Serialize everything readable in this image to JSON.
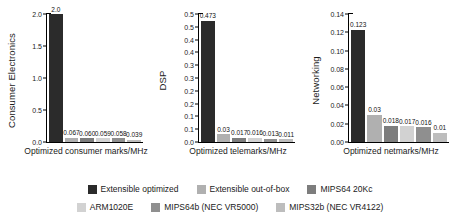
{
  "chart_data": [
    {
      "type": "bar",
      "title": "",
      "ylabel": "Consumer Electronics",
      "xlabel": "Optimized consumer marks/MHz",
      "ylim": [
        0.0,
        2.0
      ],
      "yticks": [
        "0.0",
        "0.5",
        "1.0",
        "1.5",
        "2.0"
      ],
      "ytick_values": [
        0.0,
        0.5,
        1.0,
        1.5,
        2.0
      ],
      "grid": false,
      "categories": [
        "Extensible optimized",
        "Extensible out-of-box",
        "MIPS64 20Kc",
        "ARM1020E",
        "MIPS64b (NEC VR5000)",
        "MIPS32b (NEC VR4122)"
      ],
      "values": [
        2.0,
        0.067,
        0.06,
        0.059,
        0.058,
        0.039
      ],
      "labels": [
        "2.0",
        "0.067",
        "0.060",
        "0.059",
        "0.058",
        "0.039"
      ]
    },
    {
      "type": "bar",
      "title": "",
      "ylabel": "DSP",
      "xlabel": "Optimized telemarks/MHz",
      "ylim": [
        0.0,
        0.5
      ],
      "yticks": [
        "0.0",
        "0.1",
        "0.1",
        "0.2",
        "0.2",
        "0.3",
        "0.3",
        "0.4",
        "0.4",
        "0.5",
        "0.5"
      ],
      "ytick_values": [
        0.0,
        0.05,
        0.1,
        0.15,
        0.2,
        0.25,
        0.3,
        0.35,
        0.4,
        0.45,
        0.5
      ],
      "grid": false,
      "categories": [
        "Extensible optimized",
        "Extensible out-of-box",
        "MIPS64 20Kc",
        "ARM1020E",
        "MIPS64b (NEC VR5000)",
        "MIPS32b (NEC VR4122)"
      ],
      "values": [
        0.473,
        0.03,
        0.017,
        0.016,
        0.013,
        0.011
      ],
      "labels": [
        "0.473",
        "0.03",
        "0.017",
        "0.016",
        "0.013",
        "0.011"
      ]
    },
    {
      "type": "bar",
      "title": "",
      "ylabel": "Networking",
      "xlabel": "Optimized netmarks/MHz",
      "ylim": [
        0.0,
        0.14
      ],
      "yticks": [
        "0.00",
        "0.02",
        "0.04",
        "0.06",
        "0.08",
        "0.10",
        "0.12",
        "0.14"
      ],
      "ytick_values": [
        0.0,
        0.02,
        0.04,
        0.06,
        0.08,
        0.1,
        0.12,
        0.14
      ],
      "grid": false,
      "categories": [
        "Extensible optimized",
        "Extensible out-of-box",
        "MIPS64 20Kc",
        "ARM1020E",
        "MIPS64b (NEC VR5000)",
        "MIPS32b (NEC VR4122)"
      ],
      "values": [
        0.123,
        0.03,
        0.018,
        0.017,
        0.016,
        0.01
      ],
      "labels": [
        "0.123",
        "0.03",
        "0.018",
        "0.017",
        "0.016",
        "0.01"
      ]
    }
  ],
  "series_colors": [
    "#2b2b2b",
    "#b0b0b0",
    "#7d7d7d",
    "#d2d2d2",
    "#8f8f8f",
    "#bdbdbd"
  ],
  "legend": {
    "position": "bottom",
    "row1": [
      {
        "label": "Extensible optimized",
        "color": "#2b2b2b"
      },
      {
        "label": "Extensible out-of-box",
        "color": "#b0b0b0"
      },
      {
        "label": "MIPS64 20Kc",
        "color": "#7d7d7d"
      }
    ],
    "row2": [
      {
        "label": "ARM1020E",
        "color": "#d2d2d2"
      },
      {
        "label": "MIPS64b (NEC VR5000)",
        "color": "#8f8f8f"
      },
      {
        "label": "MIPS32b (NEC VR4122)",
        "color": "#bdbdbd"
      }
    ]
  }
}
